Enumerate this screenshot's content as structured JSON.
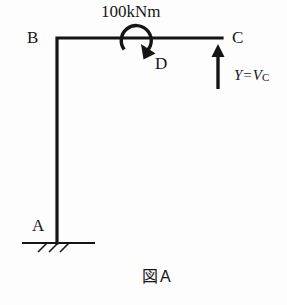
{
  "figure": {
    "caption_jp": "図",
    "caption_letter": "A",
    "caption_full": "図A"
  },
  "nodes": {
    "a": "A",
    "b": "B",
    "c": "C",
    "d": "D"
  },
  "loads": {
    "moment_label": "100kNm",
    "moment_direction": "clockwise",
    "moment_at_node": "D",
    "force_var": "Y",
    "force_equals": "=",
    "force_value_symbol": "V",
    "force_value_subscript": "C",
    "force_label_full": "Y = VC",
    "force_direction": "up",
    "force_at_node": "C"
  },
  "support": {
    "type": "fixed-support",
    "at_node": "A",
    "hatch_count": 3
  },
  "style": {
    "ink": "#151515",
    "paper": "#fdfdfd",
    "member_width": 3.2
  },
  "geometry": {
    "corner_b": [
      57,
      38
    ],
    "end_c": [
      222,
      38
    ],
    "base_a": [
      57,
      243
    ],
    "moment_center": [
      137,
      40
    ],
    "moment_radius": 15,
    "force_arrow_x": 218,
    "force_arrow_top": 45,
    "force_arrow_bottom": 89,
    "ground_line": [
      22,
      95,
      243
    ]
  }
}
